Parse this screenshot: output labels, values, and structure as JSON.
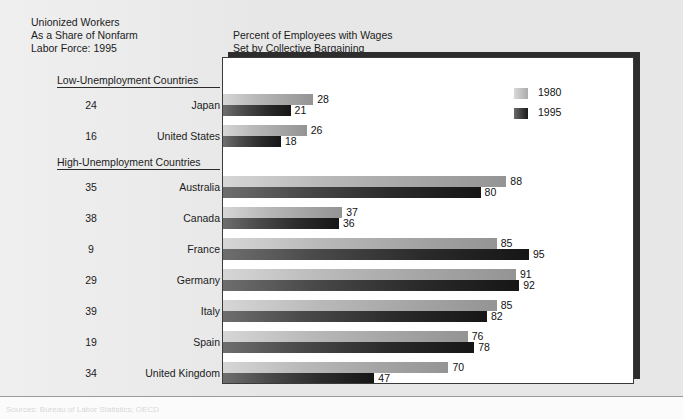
{
  "titles": {
    "left": "Unionized Workers\nAs a Share of Nonfarm\nLabor Force: 1995",
    "right": "Percent of Employees with Wages\nSet by Collective Bargaining"
  },
  "sections": {
    "low": "Low-Unemployment Countries",
    "high": "High-Unemployment Countries"
  },
  "legend": {
    "items": [
      {
        "label": "1980",
        "swatch": "light-gray-gradient",
        "color": "#b9b9b9"
      },
      {
        "label": "1995",
        "swatch": "dark-gradient",
        "color": "#242424"
      }
    ]
  },
  "caption_ghost": "Sources: Bureau of Labor Statistics; OECD",
  "chart_data": {
    "type": "bar",
    "orientation": "horizontal",
    "title": "Percent of Employees with Wages Set by Collective Bargaining",
    "xlabel": "",
    "ylabel": "",
    "xlim": [
      0,
      100
    ],
    "grid": false,
    "legend_position": "top-right",
    "categories": [
      "Japan",
      "United States",
      "Australia",
      "Canada",
      "France",
      "Germany",
      "Italy",
      "Spain",
      "United Kingdom"
    ],
    "groups": [
      {
        "name": "Low-Unemployment Countries",
        "categories": [
          "Japan",
          "United States"
        ]
      },
      {
        "name": "High-Unemployment Countries",
        "categories": [
          "Australia",
          "Canada",
          "France",
          "Germany",
          "Italy",
          "Spain",
          "United Kingdom"
        ]
      }
    ],
    "series": [
      {
        "name": "1980",
        "values": [
          28,
          26,
          88,
          37,
          85,
          91,
          85,
          76,
          70
        ]
      },
      {
        "name": "1995",
        "values": [
          21,
          18,
          80,
          36,
          95,
          92,
          82,
          78,
          47
        ]
      }
    ],
    "side_series": {
      "name": "Unionized Workers As a Share of Nonfarm Labor Force: 1995",
      "values": [
        24,
        16,
        35,
        38,
        9,
        29,
        39,
        19,
        34
      ]
    }
  },
  "rows": [
    {
      "country": "Japan",
      "union": "24",
      "v1980": "28",
      "v1995": "21"
    },
    {
      "country": "United States",
      "union": "16",
      "v1980": "26",
      "v1995": "18"
    },
    {
      "country": "Australia",
      "union": "35",
      "v1980": "88",
      "v1995": "80"
    },
    {
      "country": "Canada",
      "union": "38",
      "v1980": "37",
      "v1995": "36"
    },
    {
      "country": "France",
      "union": "9",
      "v1980": "85",
      "v1995": "95"
    },
    {
      "country": "Germany",
      "union": "29",
      "v1980": "91",
      "v1995": "92"
    },
    {
      "country": "Italy",
      "union": "39",
      "v1980": "85",
      "v1995": "82"
    },
    {
      "country": "Spain",
      "union": "19",
      "v1980": "76",
      "v1995": "78"
    },
    {
      "country": "United Kingdom",
      "union": "34",
      "v1980": "70",
      "v1995": "47"
    }
  ]
}
